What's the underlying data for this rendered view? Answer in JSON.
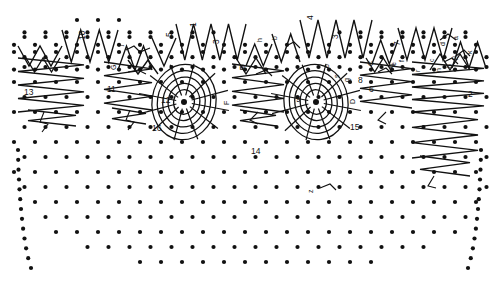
{
  "figure": {
    "title": "",
    "background": "#ffffff",
    "ink_color": "#111111",
    "width": 499,
    "height": 282
  },
  "number_labels": [
    {
      "id": "lbl-13",
      "text": "13",
      "x": 24,
      "y": 95,
      "rotated": false
    },
    {
      "id": "lbl-11",
      "text": "11",
      "x": 107,
      "y": 92,
      "rotated": false
    },
    {
      "id": "lbl-12",
      "text": "12",
      "x": 161,
      "y": 103,
      "rotated": false
    },
    {
      "id": "lbl-16",
      "text": "16",
      "x": 152,
      "y": 131,
      "rotated": false
    },
    {
      "id": "lbl-14",
      "text": "14",
      "x": 251,
      "y": 154,
      "rotated": false
    },
    {
      "id": "lbl-9",
      "text": "9",
      "x": 296,
      "y": 102,
      "rotated": false
    },
    {
      "id": "lbl-15",
      "text": "15",
      "x": 350,
      "y": 130,
      "rotated": false
    },
    {
      "id": "lbl-6",
      "text": "6",
      "x": 369,
      "y": 92,
      "rotated": false
    },
    {
      "id": "lbl-2",
      "text": "2",
      "x": 468,
      "y": 97,
      "rotated": false
    },
    {
      "id": "lbl-10",
      "text": "10",
      "x": 85,
      "y": 40,
      "rotated": true
    },
    {
      "id": "lbl-5",
      "text": "5",
      "x": 172,
      "y": 37,
      "rotated": true
    },
    {
      "id": "lbl-1",
      "text": "1",
      "x": 196,
      "y": 27,
      "rotated": true
    },
    {
      "id": "lbl-3",
      "text": "3",
      "x": 219,
      "y": 44,
      "rotated": true
    },
    {
      "id": "lbl-4",
      "text": "4",
      "x": 313,
      "y": 20,
      "rotated": true
    },
    {
      "id": "lbl-3b",
      "text": "3",
      "x": 338,
      "y": 39,
      "rotated": true
    },
    {
      "id": "lbl-7",
      "text": "7",
      "x": 400,
      "y": 46,
      "rotated": true
    },
    {
      "id": "lbl-8",
      "text": "8",
      "x": 358,
      "y": 83,
      "rotated": false
    }
  ],
  "letter_labels": [
    {
      "id": "ltr-j",
      "text": "j",
      "x": 122,
      "y": 46
    },
    {
      "id": "ltr-G",
      "text": "G",
      "x": 116,
      "y": 70
    },
    {
      "id": "ltr-E",
      "text": "E",
      "x": 245,
      "y": 70
    },
    {
      "id": "ltr-F",
      "text": "F",
      "x": 229,
      "y": 105
    },
    {
      "id": "ltr-m",
      "text": "m",
      "x": 244,
      "y": 70
    },
    {
      "id": "ltr-h",
      "text": "h",
      "x": 262,
      "y": 42
    },
    {
      "id": "ltr-b",
      "text": "b",
      "x": 277,
      "y": 40
    },
    {
      "id": "ltr-o",
      "text": "o",
      "x": 329,
      "y": 68
    },
    {
      "id": "ltr-s",
      "text": "s",
      "x": 339,
      "y": 78
    },
    {
      "id": "ltr-g",
      "text": "g",
      "x": 349,
      "y": 82
    },
    {
      "id": "ltr-D",
      "text": "D",
      "x": 355,
      "y": 104
    },
    {
      "id": "ltr-C",
      "text": "C",
      "x": 373,
      "y": 66
    },
    {
      "id": "ltr-q",
      "text": "q",
      "x": 393,
      "y": 68
    },
    {
      "id": "ltr-e",
      "text": "e",
      "x": 396,
      "y": 66
    },
    {
      "id": "ltr-f",
      "text": "f",
      "x": 404,
      "y": 62
    },
    {
      "id": "ltr-r",
      "text": "r",
      "x": 420,
      "y": 72
    },
    {
      "id": "ltr-c",
      "text": "c",
      "x": 434,
      "y": 62
    },
    {
      "id": "ltr-d",
      "text": "d",
      "x": 445,
      "y": 46
    },
    {
      "id": "ltr-a",
      "text": "a",
      "x": 458,
      "y": 40
    },
    {
      "id": "ltr-k",
      "text": "k",
      "x": 472,
      "y": 54
    },
    {
      "id": "ltr-p",
      "text": "p",
      "x": 456,
      "y": 60
    },
    {
      "id": "ltr-b2",
      "text": "b",
      "x": 452,
      "y": 68
    },
    {
      "id": "ltr-n",
      "text": "n",
      "x": 441,
      "y": 72
    },
    {
      "id": "ltr-z",
      "text": "z",
      "x": 313,
      "y": 193
    }
  ],
  "vortices": [
    {
      "id": "vortex-left",
      "cx": 184,
      "cy": 102,
      "rings": 5,
      "spokes": 12,
      "label": "12"
    },
    {
      "id": "vortex-right",
      "cx": 316,
      "cy": 102,
      "rings": 5,
      "spokes": 12,
      "label": "9"
    }
  ],
  "structure": {
    "lattice_description": "diamond dot lattice",
    "dot_radius": 2.1,
    "zigzag_rows": 3,
    "side_fan_left": "13",
    "side_fan_right": "2"
  }
}
